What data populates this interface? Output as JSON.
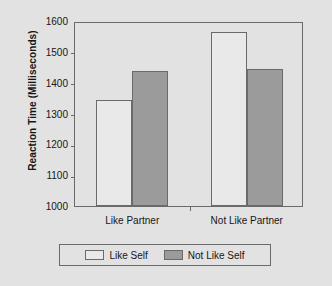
{
  "chart_data": {
    "type": "bar",
    "title": "",
    "xlabel": "",
    "ylabel": "Reaction Time (Milliseconds)",
    "categories": [
      "Like Partner",
      "Not Like Partner"
    ],
    "series": [
      {
        "name": "Like Self",
        "values": [
          1345,
          1565
        ],
        "color": "#e9e9e9"
      },
      {
        "name": "Not Like Self",
        "values": [
          1437,
          1445
        ],
        "color": "#9b9b9b"
      }
    ],
    "ylim": [
      1000,
      1600
    ],
    "ytick_step": 100,
    "yticks": [
      1000,
      1100,
      1200,
      1300,
      1400,
      1500,
      1600
    ],
    "ytick_labels": [
      "1000",
      "1100",
      "1200",
      "1300",
      "1400",
      "1500",
      "1600"
    ],
    "grid": false,
    "legend_position": "bottom",
    "frame_color": "#6a6a6a",
    "background_color": "#e2e2e2"
  }
}
